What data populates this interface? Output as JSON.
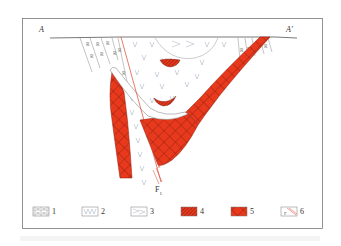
{
  "figure": {
    "section_labels": {
      "left": "A",
      "right": "A'"
    },
    "fault_label": "F",
    "fault_subscript": "1",
    "colors": {
      "ore_red": "#e8391d",
      "ore_dark": "#8a1a0a",
      "frame": "#777777",
      "rock_line": "#888888",
      "vsymbol": "#9aa6b8",
      "fault_line": "#d9452c"
    },
    "legend": [
      {
        "num": "1",
        "name": "brick-pattern-unit"
      },
      {
        "num": "2",
        "name": "v-pattern-volcanic-unit"
      },
      {
        "num": "3",
        "name": "chevron-pattern-unit"
      },
      {
        "num": "4",
        "name": "hatched-red-orebody"
      },
      {
        "num": "5",
        "name": "crosshatched-red-orebody"
      },
      {
        "num": "6",
        "name": "fault-symbol"
      }
    ]
  }
}
